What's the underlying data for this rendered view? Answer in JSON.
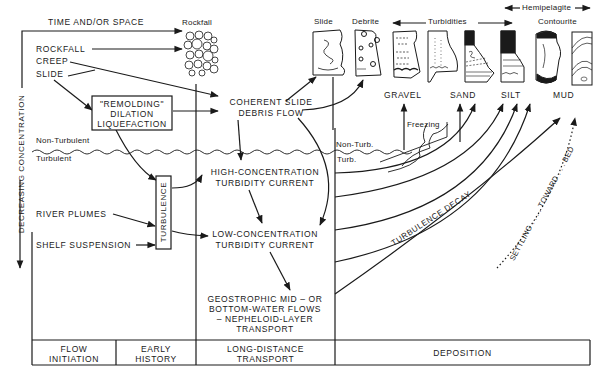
{
  "axes": {
    "horizontal": "TIME AND/OR SPACE",
    "vertical": "DECREASING CONCENTRATION"
  },
  "facies_headers": {
    "rockfall": "Rockfall",
    "slide": "Slide",
    "debrite": "Debrite",
    "turbidities": "Turbidities",
    "hemipelagite": "Hemipelagite",
    "contourite": "Contourite"
  },
  "grain_sizes": [
    "GRAVEL",
    "SAND",
    "SILT",
    "MUD"
  ],
  "initiation_processes": {
    "rockfall": "ROCKFALL",
    "creep": "CREEP",
    "slide": "SLIDE",
    "river_plumes": "RIVER PLUMES",
    "shelf_suspension": "SHELF SUSPENSION"
  },
  "remolding_box": [
    "\"REMOLDING\"",
    "DILATION",
    "LIQUEFACTION"
  ],
  "turbulence_box": "TURBULENCE",
  "flow_regime": {
    "non_turbulent": "Non-Turbulent",
    "turbulent": "Turbulent",
    "non_turb_short": "Non-Turb.",
    "turb_short": "Turb.",
    "freezing": "Freezing"
  },
  "transport_nodes": {
    "coherent": [
      "COHERENT SLIDE",
      "DEBRIS FLOW"
    ],
    "high_conc": [
      "HIGH-CONCENTRATION",
      "TURBIDITY CURRENT"
    ],
    "low_conc": [
      "LOW-CONCENTRATION",
      "TURBIDITY CURRENT"
    ],
    "geostrophic": [
      "GEOSTROPHIC MID – OR",
      "BOTTOM-WATER FLOWS",
      "– NEPHELOID-LAYER",
      "TRANSPORT"
    ]
  },
  "deposition_labels": {
    "turbulence_decay": "TURBULENCE DECAY",
    "settling": "SETTLING . . . . TOWARD . . . BED"
  },
  "stages": [
    {
      "label": [
        "FLOW",
        "INITIATION"
      ]
    },
    {
      "label": [
        "EARLY",
        "HISTORY"
      ]
    },
    {
      "label": [
        "LONG-DISTANCE",
        "TRANSPORT"
      ]
    },
    {
      "label": [
        "DEPOSITION"
      ]
    }
  ],
  "colors": {
    "ink": "#1a1a1a",
    "paper": "#ffffff"
  }
}
